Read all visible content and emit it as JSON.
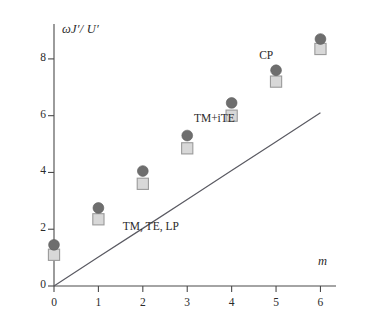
{
  "chart_data": {
    "type": "scatter",
    "title": "",
    "xlabel": "m",
    "ylabel": "ωJ′/ U′",
    "x": [
      0,
      1,
      2,
      3,
      4,
      5,
      6
    ],
    "xlim": [
      0,
      6.35
    ],
    "ylim": [
      0,
      9.3
    ],
    "xticks": [
      "0",
      "1",
      "2",
      "3",
      "4",
      "5",
      "6"
    ],
    "yticks": [
      "0",
      "2",
      "4",
      "6",
      "8"
    ],
    "ytick_values": [
      0,
      2,
      4,
      6,
      8
    ],
    "grid": false,
    "legend_position": "inline-annotations",
    "series": [
      {
        "name": "TM+iTE",
        "marker": "circle",
        "color": "#6e6e6e",
        "values": [
          1.45,
          2.75,
          4.05,
          5.3,
          6.45,
          7.6,
          8.7
        ]
      },
      {
        "name": "CP",
        "marker": "square",
        "color": "#d8d8d8",
        "edge_color": "#9a9a9a",
        "values": [
          1.1,
          2.35,
          3.6,
          4.85,
          6.0,
          7.2,
          8.35
        ]
      },
      {
        "name": "TM, TE, LP",
        "marker": "line",
        "color": "#5a5a62",
        "values": [
          0,
          1.02,
          2.03,
          3.05,
          4.07,
          5.08,
          6.1
        ]
      }
    ],
    "annotations": [
      {
        "text": "CP",
        "x": 4.62,
        "y": 8.05
      },
      {
        "text": "TM+iTE",
        "x": 3.15,
        "y": 5.85
      },
      {
        "text": "TM, TE, LP",
        "x": 1.55,
        "y": 2.05
      }
    ]
  },
  "axes": {
    "y_axis_caption": "ωJ′/ U′",
    "x_axis_caption": "m"
  },
  "colors": {
    "circle_fill": "#6e6e6e",
    "square_fill": "#dcdcdc",
    "square_edge": "#a0a0a0",
    "line": "#5a5a62",
    "axis": "#4a4a4a",
    "text": "#2b2b2b"
  }
}
